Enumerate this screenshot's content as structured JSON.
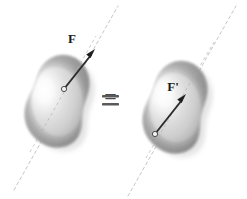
{
  "figure": {
    "background_color": "#ffffff",
    "width": 247,
    "height": 199
  },
  "relation": {
    "symbol": "=",
    "name": "equals-sign",
    "color": "#555555"
  },
  "line_of_action": {
    "style": "dashed",
    "color": "#c6c6c6",
    "dash_pattern": "3 3",
    "stroke_width": 1
  },
  "body_colors": {
    "highlight": "#fdfdfd",
    "mid": "#d4d4d4",
    "shadow": "#9a9a9a",
    "edge": "#8d8d8d"
  },
  "arrow_colors": {
    "shaft": "#2b2b2b",
    "head": "#1f1f1f",
    "application_point_fill": "#f2f2f2",
    "application_point_stroke": "#4a4a4a"
  },
  "panels": [
    {
      "id": "left",
      "name": "left-rigid-body-panel",
      "body_name": "rigid-body-left",
      "force": {
        "label": "F",
        "label_x": 72,
        "label_y": 43,
        "tail_x": 64,
        "tail_y": 89,
        "tip_x": 95,
        "tip_y": 50,
        "application_point_x": 64,
        "application_point_y": 89,
        "description": "Force F applied at upper application point on the line of action"
      }
    },
    {
      "id": "right",
      "name": "right-rigid-body-panel",
      "body_name": "rigid-body-right",
      "force": {
        "label": "F'",
        "label_x": 173,
        "label_y": 91,
        "tail_x": 155,
        "tail_y": 134,
        "tip_x": 186,
        "tip_y": 95,
        "application_point_x": 155,
        "application_point_y": 134,
        "description": "Force F prime applied at lower application point on the same line of action"
      }
    }
  ]
}
